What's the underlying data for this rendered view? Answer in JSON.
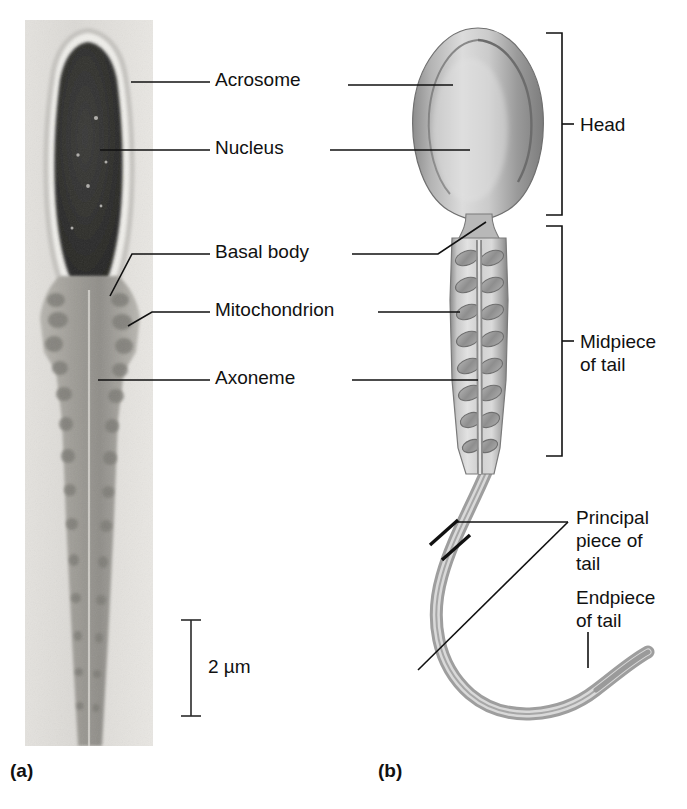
{
  "figure": {
    "panels": [
      {
        "id": "a",
        "label": "(a)",
        "kind": "electron-micrograph"
      },
      {
        "id": "b",
        "label": "(b)",
        "kind": "illustration"
      }
    ]
  },
  "labels": {
    "acrosome": "Acrosome",
    "nucleus": "Nucleus",
    "basal_body": "Basal body",
    "mitochondrion": "Mitochondrion",
    "axoneme": "Axoneme"
  },
  "regions": {
    "head": "Head",
    "midpiece_line1": "Midpiece",
    "midpiece_line2": "of tail",
    "principal_line1": "Principal",
    "principal_line2": "piece of",
    "principal_line3": "tail",
    "endpiece_line1": "Endpiece",
    "endpiece_line2": "of tail"
  },
  "scale": {
    "value": "2 µm"
  },
  "panel_labels": {
    "a": "(a)",
    "b": "(b)"
  },
  "colors": {
    "ink": "#111111",
    "micrograph_background": "#dedcd8",
    "nucleus_dark": "#2b2b2b",
    "acrosome_gray": "#9a9a98",
    "illustration_gray": "#a8a8a8",
    "illustration_light": "#e8e8e8",
    "page": "#ffffff"
  }
}
